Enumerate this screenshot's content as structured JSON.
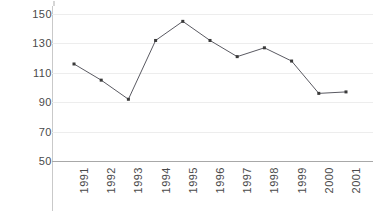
{
  "chart_data": {
    "type": "line",
    "title": "",
    "subtitle": "",
    "xlabel": "",
    "ylabel": "",
    "categories": [
      "1991",
      "1992",
      "1993",
      "1994",
      "1995",
      "1996",
      "1997",
      "1998",
      "1999",
      "2000",
      "2001"
    ],
    "values": [
      116,
      105,
      92,
      132,
      145,
      132,
      121,
      127,
      118,
      96,
      97
    ],
    "series": [
      {
        "name": "series-1",
        "values": [
          116,
          105,
          92,
          132,
          145,
          132,
          121,
          127,
          118,
          96,
          97
        ]
      }
    ],
    "ylim": [
      50,
      150
    ],
    "yticks": [
      50,
      70,
      90,
      110,
      130,
      150
    ],
    "ytick_labels": [
      "50",
      "70",
      "90",
      "110",
      "130",
      "150"
    ],
    "xtick_labels": [
      "1991",
      "1992",
      "1993",
      "1994",
      "1995",
      "1996",
      "1997",
      "1998",
      "1999",
      "2000",
      "2001"
    ],
    "xtick_rotation": 90,
    "grid": true,
    "grid_axis": "y",
    "legend": false,
    "legend_position": "none",
    "annotations": [],
    "colors": {
      "line": "#5a5a62",
      "marker": "#3a3a3a",
      "gridline": "#ededed",
      "axis": "#c9c9c9",
      "baseline": "#a8a8a8",
      "tick_label": "#4a4a4a",
      "background": "#ffffff"
    },
    "marker_style": "square",
    "marker_size": 3
  }
}
